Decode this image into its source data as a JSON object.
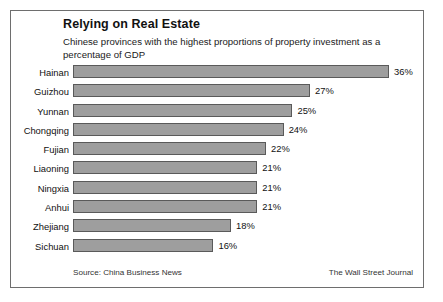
{
  "card": {
    "title": "Relying on Real Estate",
    "subtitle": "Chinese provinces with the highest proportions of property investment as a percentage of GDP",
    "source": "Source: China Business News",
    "publisher": "The Wall Street Journal",
    "bar_fill_color": "#9e9e9e",
    "bar_border_color": "#5a5a5a",
    "frame_color": "#6e6e6e",
    "background_color": "#ffffff"
  },
  "chart_data": {
    "type": "bar",
    "orientation": "horizontal",
    "title": "Relying on Real Estate",
    "subtitle": "Chinese provinces with the highest proportions of property investment as a percentage of GDP",
    "xlabel": "",
    "ylabel": "",
    "unit": "%",
    "xlim": [
      0,
      36
    ],
    "grid": false,
    "legend": null,
    "categories": [
      "Hainan",
      "Guizhou",
      "Yunnan",
      "Chongqing",
      "Fujian",
      "Liaoning",
      "Ningxia",
      "Anhui",
      "Zhejiang",
      "Sichuan"
    ],
    "values": [
      36,
      27,
      25,
      24,
      22,
      21,
      21,
      21,
      18,
      16
    ],
    "value_labels": [
      "36%",
      "27%",
      "25%",
      "24%",
      "22%",
      "21%",
      "21%",
      "21%",
      "18%",
      "16%"
    ],
    "rows": [
      {
        "label": "Hainan",
        "value": 36,
        "value_label": "36%"
      },
      {
        "label": "Guizhou",
        "value": 27,
        "value_label": "27%"
      },
      {
        "label": "Yunnan",
        "value": 25,
        "value_label": "25%"
      },
      {
        "label": "Chongqing",
        "value": 24,
        "value_label": "24%"
      },
      {
        "label": "Fujian",
        "value": 22,
        "value_label": "22%"
      },
      {
        "label": "Liaoning",
        "value": 21,
        "value_label": "21%"
      },
      {
        "label": "Ningxia",
        "value": 21,
        "value_label": "21%"
      },
      {
        "label": "Anhui",
        "value": 21,
        "value_label": "21%"
      },
      {
        "label": "Zhejiang",
        "value": 18,
        "value_label": "18%"
      },
      {
        "label": "Sichuan",
        "value": 16,
        "value_label": "16%"
      }
    ]
  }
}
